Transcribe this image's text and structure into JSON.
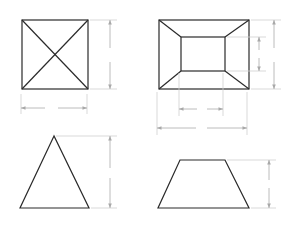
{
  "diagram": {
    "colors": {
      "shape_stroke": "#2a2a2a",
      "dimension_stroke": "#b4b4b4",
      "extension_stroke": "#cfcfcf",
      "background": "#ffffff"
    },
    "views": [
      {
        "id": "pyramid-top-view",
        "shape": "square with diagonals",
        "dimensions": [
          "height",
          "width"
        ]
      },
      {
        "id": "frustum-top-view",
        "shape": "outer rectangle with inner rectangle and corner connectors",
        "dimensions": [
          "inner height",
          "outer height",
          "inner width",
          "outer width"
        ]
      },
      {
        "id": "pyramid-front-view",
        "shape": "triangle",
        "dimensions": [
          "height"
        ]
      },
      {
        "id": "frustum-front-view",
        "shape": "trapezoid",
        "dimensions": [
          "height"
        ]
      }
    ]
  }
}
